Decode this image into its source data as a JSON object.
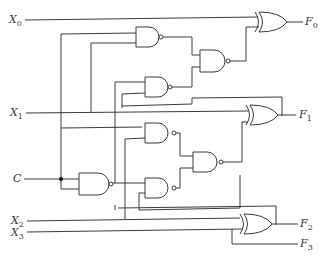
{
  "diagram": {
    "type": "logic-circuit",
    "inputs": [
      {
        "id": "X0",
        "label": "X",
        "sub": "0"
      },
      {
        "id": "X1",
        "label": "X",
        "sub": "1"
      },
      {
        "id": "C",
        "label": "C",
        "sub": ""
      },
      {
        "id": "X2",
        "label": "X",
        "sub": "2"
      },
      {
        "id": "X3",
        "label": "X",
        "sub": "3"
      }
    ],
    "outputs": [
      {
        "id": "F0",
        "label": "F",
        "sub": "0"
      },
      {
        "id": "F1",
        "label": "F",
        "sub": "1"
      },
      {
        "id": "F2",
        "label": "F",
        "sub": "2"
      },
      {
        "id": "F3",
        "label": "F",
        "sub": "3"
      }
    ],
    "gates": [
      {
        "id": "nand-c",
        "type": "NAND"
      },
      {
        "id": "nand-top-1",
        "type": "NAND"
      },
      {
        "id": "nand-top-2",
        "type": "NAND"
      },
      {
        "id": "nand-top-out",
        "type": "NAND"
      },
      {
        "id": "nand-mid-1",
        "type": "NAND"
      },
      {
        "id": "nand-mid-2",
        "type": "NAND"
      },
      {
        "id": "nand-mid-out",
        "type": "NAND"
      },
      {
        "id": "xor-f0",
        "type": "XOR"
      },
      {
        "id": "xor-f1",
        "type": "XOR"
      },
      {
        "id": "xor-f2",
        "type": "XOR"
      }
    ],
    "colors": {
      "wire": "#3a3a3a",
      "background": "#ffffff",
      "junction": "#111111"
    }
  }
}
